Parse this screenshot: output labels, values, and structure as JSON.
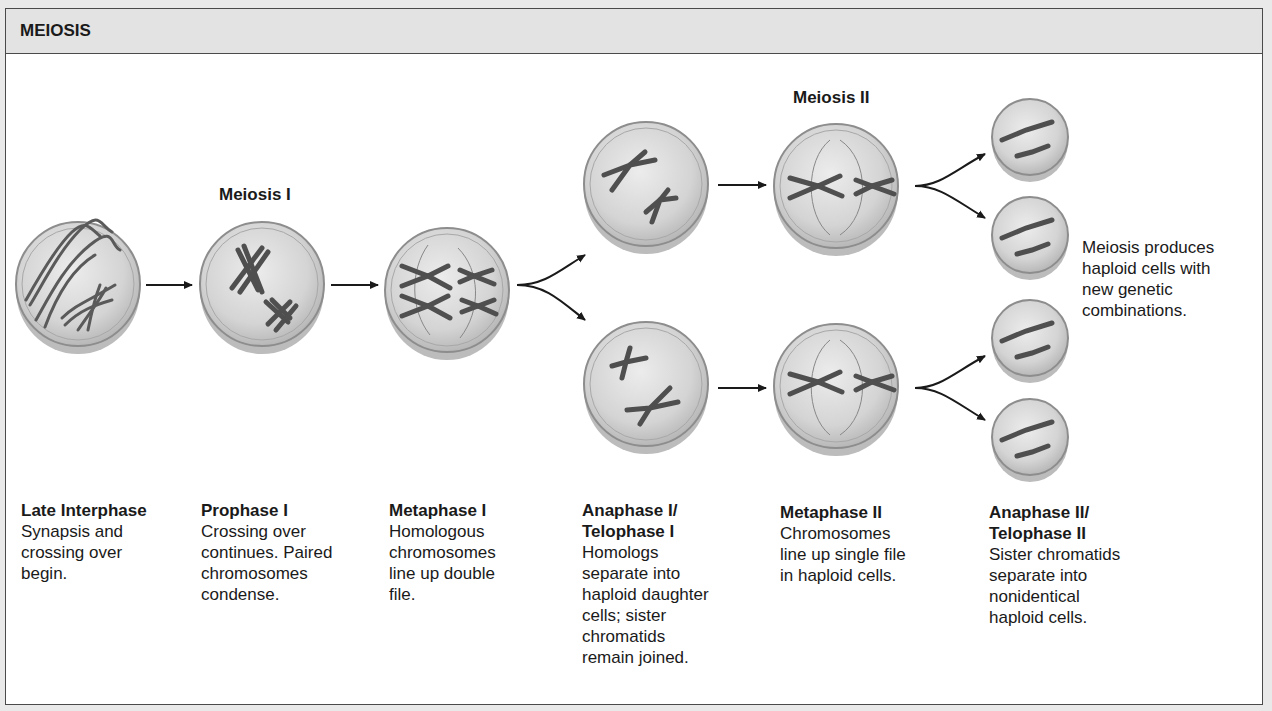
{
  "header": {
    "title": "MEIOSIS"
  },
  "section_labels": {
    "meiosis_1": "Meiosis I",
    "meiosis_2": "Meiosis II"
  },
  "stages": [
    {
      "title": "Late Interphase",
      "description": "Synapsis and\ncrossing over\nbegin."
    },
    {
      "title": "Prophase I",
      "description": "Crossing over\ncontinues. Paired\nchromosomes\ncondense."
    },
    {
      "title": "Metaphase I",
      "description": "Homologous\nchromosomes\nline up double\nfile."
    },
    {
      "title": "Anaphase I/\nTelophase I",
      "description": "Homologs\nseparate into\nhaploid daughter\ncells; sister\nchromatids\nremain joined."
    },
    {
      "title": "Metaphase II",
      "description": "Chromosomes\nline up single file\nin haploid cells."
    },
    {
      "title": "Anaphase II/\nTelophase II",
      "description": "Sister chromatids\nseparate into\nnonidentical\nhaploid cells."
    }
  ],
  "summary": "Meiosis produces\nhaploid cells with\nnew genetic\ncombinations.",
  "colors": {
    "cell_fill": "#d6d6d6",
    "cell_rim": "#9a9a9a",
    "chromosome": "#555555",
    "arrow": "#1a1a1a"
  }
}
